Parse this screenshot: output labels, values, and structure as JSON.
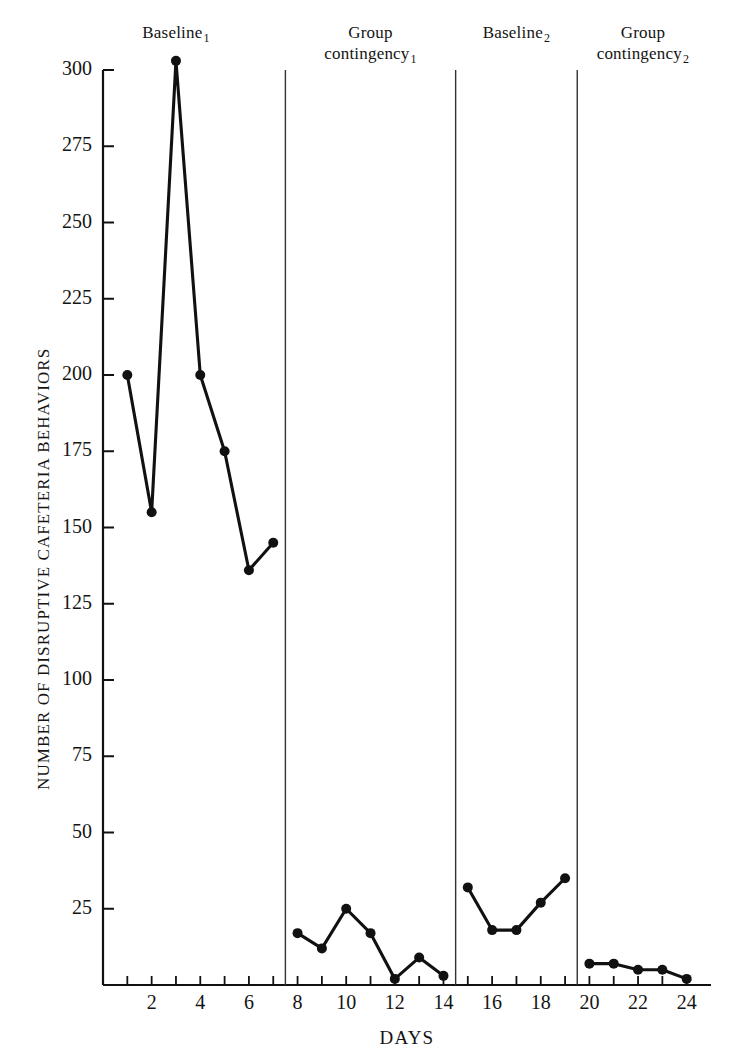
{
  "chart_data": {
    "type": "line",
    "title": "",
    "xlabel": "DAYS",
    "ylabel": "NUMBER OF DISRUPTIVE CAFETERIA BEHAVIORS",
    "xlim": [
      0,
      25
    ],
    "ylim": [
      0,
      300
    ],
    "grid": false,
    "legend": null,
    "y_ticks": [
      25,
      50,
      75,
      100,
      125,
      150,
      175,
      200,
      225,
      250,
      275,
      300
    ],
    "y_tick_labels": [
      "25",
      "50",
      "75",
      "100",
      "125",
      "150",
      "175",
      "200",
      "225",
      "250",
      "275",
      "300"
    ],
    "x_ticks": [
      1,
      2,
      3,
      4,
      5,
      6,
      7,
      8,
      9,
      10,
      11,
      12,
      13,
      14,
      15,
      16,
      17,
      18,
      19,
      20,
      21,
      22,
      23,
      24
    ],
    "x_tick_labels_shown": [
      "2",
      "4",
      "6",
      "8",
      "10",
      "12",
      "14",
      "16",
      "18",
      "20",
      "22",
      "24"
    ],
    "x_tick_label_values": [
      2,
      4,
      6,
      8,
      10,
      12,
      14,
      16,
      18,
      20,
      22,
      24
    ],
    "marker": "filled-circle",
    "line_color": "#111111",
    "marker_color": "#111111",
    "phase_divider_positions": [
      7.5,
      14.5,
      19.5
    ],
    "phases": [
      {
        "name": "Baseline",
        "subscript": "1",
        "label_line1": "Baseline",
        "label_line2": "",
        "x": [
          1,
          2,
          3,
          4,
          5,
          6,
          7
        ],
        "y": [
          200,
          155,
          303,
          200,
          175,
          136,
          145
        ]
      },
      {
        "name": "Group contingency",
        "subscript": "1",
        "label_line1": "Group",
        "label_line2": "contingency",
        "x": [
          8,
          9,
          10,
          11,
          12,
          13,
          14
        ],
        "y": [
          17,
          12,
          25,
          17,
          2,
          9,
          3
        ]
      },
      {
        "name": "Baseline",
        "subscript": "2",
        "label_line1": "Baseline",
        "label_line2": "",
        "x": [
          15,
          16,
          17,
          18,
          19
        ],
        "y": [
          32,
          18,
          18,
          27,
          35
        ]
      },
      {
        "name": "Group contingency",
        "subscript": "2",
        "label_line1": "Group",
        "label_line2": "contingency",
        "x": [
          20,
          21,
          22,
          23,
          24
        ],
        "y": [
          7,
          7,
          5,
          5,
          2
        ]
      }
    ]
  },
  "axis_label_x": "DAYS",
  "axis_label_y": "NUMBER OF DISRUPTIVE CAFETERIA BEHAVIORS"
}
